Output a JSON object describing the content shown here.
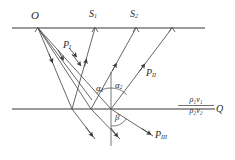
{
  "figure": {
    "width": 235,
    "height": 160,
    "background": "#ffffff",
    "line_color": "#6e6e6e",
    "ray_color": "#4a4a4a",
    "text_color": "#2b2b2b"
  },
  "labels": {
    "source": "O",
    "receiver_1": "S",
    "receiver_1_sub": "1",
    "receiver_2": "S",
    "receiver_2_sub": "2",
    "path_1": "P",
    "path_1_sub": "I",
    "path_2": "P",
    "path_2_sub": "II",
    "path_3": "P",
    "path_3_sub": "III",
    "angle_alpha_1": "α",
    "angle_alpha_1_sub": "1",
    "angle_alpha_2": "α",
    "angle_alpha_2_sub": "2",
    "angle_beta": "β",
    "impedance_upper": "ρ₁v₁",
    "impedance_lower": "ρ₂v₂",
    "interface_point": "Q"
  },
  "geometry": {
    "surface_line": {
      "x1": 12,
      "y1": 28,
      "x2": 205,
      "y2": 28
    },
    "interface_line": {
      "x1": 12,
      "y1": 109,
      "x2": 215,
      "y2": 109
    },
    "normal_line": {
      "x": 111,
      "y1": 72,
      "y2": 145
    },
    "source_point": {
      "x": 38,
      "y": 28
    },
    "surface_points": [
      {
        "x": 38,
        "y": 28,
        "name": "O"
      },
      {
        "x": 95,
        "y": 28,
        "name": "S1"
      },
      {
        "x": 136,
        "y": 28,
        "name": "S2"
      },
      {
        "x": 172,
        "y": 28,
        "name": "unlabeled"
      }
    ],
    "interface_points": [
      {
        "x": 72,
        "y": 109
      },
      {
        "x": 91,
        "y": 109
      },
      {
        "x": 111,
        "y": 109
      }
    ],
    "downgoing_rays": [
      {
        "from": [
          38,
          28
        ],
        "to": [
          72,
          109
        ]
      },
      {
        "from": [
          38,
          28
        ],
        "to": [
          91,
          109
        ]
      },
      {
        "from": [
          38,
          28
        ],
        "to": [
          111,
          109
        ]
      },
      {
        "from": [
          38,
          28
        ],
        "to": [
          90,
          97
        ]
      }
    ],
    "upgoing_rays": [
      {
        "from": [
          72,
          109
        ],
        "to": [
          95,
          28
        ]
      },
      {
        "from": [
          91,
          109
        ],
        "to": [
          136,
          28
        ]
      },
      {
        "from": [
          111,
          109
        ],
        "to": [
          172,
          28
        ]
      }
    ],
    "refracted_rays": [
      {
        "from": [
          72,
          109
        ],
        "to": [
          101,
          145
        ]
      },
      {
        "from": [
          91,
          109
        ],
        "to": [
          125,
          145
        ]
      },
      {
        "from": [
          111,
          109
        ],
        "to": [
          158,
          142
        ]
      }
    ]
  }
}
